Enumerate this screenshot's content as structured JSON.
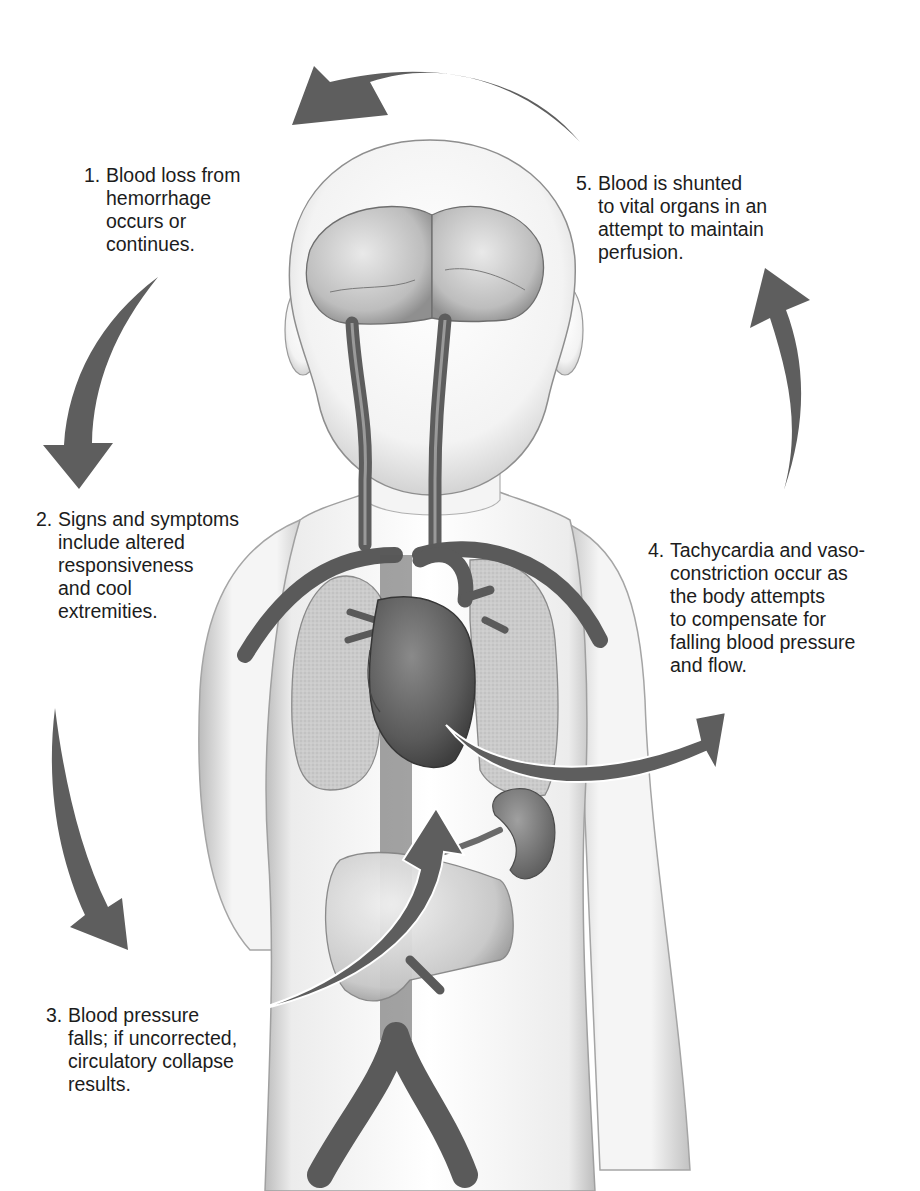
{
  "diagram": {
    "colors": {
      "arrow": "#5e5e5e",
      "vessel": "#6b6b6b",
      "vessel_dark": "#4f4f4f",
      "organ": "#8a8a8a",
      "lung": "#c9c9c9",
      "skin": "#f4f4f4",
      "outline": "#8c8c8c",
      "text": "#1c1c1c"
    },
    "steps": [
      {
        "number": "1.",
        "lines": [
          "Blood loss from",
          "hemorrhage",
          "occurs or",
          "continues."
        ]
      },
      {
        "number": "2.",
        "lines": [
          "Signs and symptoms",
          "include altered",
          "responsiveness",
          "and cool",
          "extremities."
        ]
      },
      {
        "number": "3.",
        "lines": [
          "Blood pressure",
          "falls; if uncorrected,",
          "circulatory collapse",
          "results."
        ]
      },
      {
        "number": "4.",
        "lines": [
          "Tachycardia and vaso-",
          "constriction occur as",
          "the body attempts",
          "to compensate for",
          "falling blood pressure",
          "and flow."
        ]
      },
      {
        "number": "5.",
        "lines": [
          "Blood is shunted",
          "to vital organs in an",
          "attempt to maintain",
          "perfusion."
        ]
      }
    ],
    "arrows": [
      {
        "name": "arrow-step1-to-step2",
        "direction": "down-left"
      },
      {
        "name": "arrow-step2-to-step3",
        "direction": "down-right"
      },
      {
        "name": "arrow-step3-to-heart",
        "direction": "up"
      },
      {
        "name": "arrow-heart-to-step4",
        "direction": "right"
      },
      {
        "name": "arrow-step4-to-step5",
        "direction": "up"
      },
      {
        "name": "arrow-step5-to-step1",
        "direction": "left"
      }
    ],
    "organs": [
      "brain",
      "carotid-arteries",
      "lungs",
      "heart",
      "aorta",
      "kidney",
      "liver",
      "iliac-arteries"
    ]
  }
}
